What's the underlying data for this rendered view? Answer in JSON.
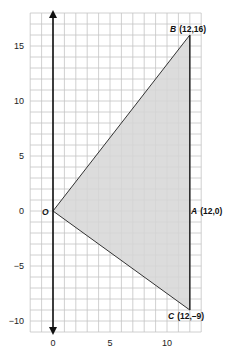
{
  "diagram": {
    "type": "coordinate-plane-triangle",
    "grid": {
      "x_min": -2,
      "x_max": 13,
      "y_min": -11,
      "y_max": 18,
      "step": 1,
      "line_color": "#c4c4c4",
      "background": "#ffffff"
    },
    "axes": {
      "y_axis_color": "#111111",
      "x_ticks": [
        {
          "value": 0,
          "label": "0"
        },
        {
          "value": 5,
          "label": "5"
        },
        {
          "value": 10,
          "label": "10"
        }
      ],
      "y_ticks": [
        {
          "value": 15,
          "label": "15"
        },
        {
          "value": 10,
          "label": "10"
        },
        {
          "value": 5,
          "label": "5"
        },
        {
          "value": 0,
          "label": "0"
        },
        {
          "value": -5,
          "label": "−5"
        },
        {
          "value": -10,
          "label": "−10"
        }
      ]
    },
    "shape": {
      "fill": "#d6d6d6",
      "stroke": "#333333",
      "vertices": [
        {
          "name": "O",
          "x": 0,
          "y": 0
        },
        {
          "name": "B",
          "x": 12,
          "y": 16
        },
        {
          "name": "C",
          "x": 12,
          "y": -9
        }
      ]
    },
    "points": [
      {
        "id": "O",
        "name": "O",
        "coords": "",
        "x": 0,
        "y": 0
      },
      {
        "id": "A",
        "name": "A",
        "coords": "(12,0)",
        "x": 12,
        "y": 0
      },
      {
        "id": "B",
        "name": "B",
        "coords": "(12,16)",
        "x": 12,
        "y": 16
      },
      {
        "id": "C",
        "name": "C",
        "coords": "(12,–9)",
        "x": 12,
        "y": -9
      }
    ]
  }
}
